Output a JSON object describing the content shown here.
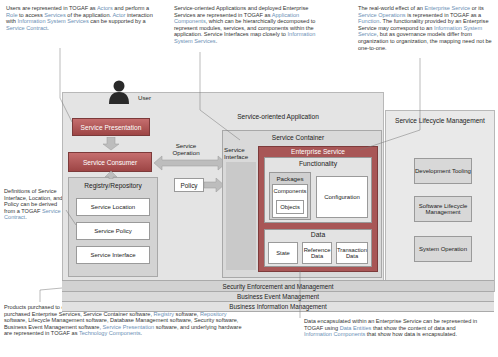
{
  "notes": {
    "top_left": {
      "segments": [
        {
          "t": "Users are represented in TOGAF as ",
          "hl": false
        },
        {
          "t": "Actors",
          "hl": true
        },
        {
          "t": " and perform a ",
          "hl": false
        },
        {
          "t": "Role",
          "hl": true
        },
        {
          "t": " to access ",
          "hl": false
        },
        {
          "t": "Services",
          "hl": true
        },
        {
          "t": " of the application. ",
          "hl": false
        },
        {
          "t": "Actor",
          "hl": true
        },
        {
          "t": " interaction with ",
          "hl": false
        },
        {
          "t": "Information System Services",
          "hl": true
        },
        {
          "t": " can be supported by a ",
          "hl": false
        },
        {
          "t": "Service Contract",
          "hl": true
        },
        {
          "t": ".",
          "hl": false
        }
      ]
    },
    "top_middle": {
      "segments": [
        {
          "t": "Service-oriented Applications and deployed Enterprise Services are represented in TOGAF as ",
          "hl": false
        },
        {
          "t": "Application Components",
          "hl": true
        },
        {
          "t": ", which can be hierarchically decomposed to represent modules, services, and components within the application. Service Interfaces map closely to ",
          "hl": false
        },
        {
          "t": "Information System Services",
          "hl": true
        },
        {
          "t": ".",
          "hl": false
        }
      ]
    },
    "top_right": {
      "segments": [
        {
          "t": "The real-world effect of an ",
          "hl": false
        },
        {
          "t": "Enterprise Service",
          "hl": true
        },
        {
          "t": " or its ",
          "hl": false
        },
        {
          "t": "Service Operations",
          "hl": true
        },
        {
          "t": " is represented in TOGAF as a ",
          "hl": false
        },
        {
          "t": "Function",
          "hl": true
        },
        {
          "t": ". The functionality provided by an Enterprise Service may correspond to an ",
          "hl": false
        },
        {
          "t": "Information System Service",
          "hl": true
        },
        {
          "t": ", but as governance models differ from organization to organization, the mapping need not be one-to-one.",
          "hl": false
        }
      ]
    },
    "mid_left": {
      "segments": [
        {
          "t": "Definitions of Service Interface, Location, and Policy can be derived from a TOGAF ",
          "hl": false
        },
        {
          "t": "Service Contract",
          "hl": true
        },
        {
          "t": ".",
          "hl": false
        }
      ]
    },
    "bottom_left": {
      "segments": [
        {
          "t": "Products purchased to create a Service-oriented Application, such as COTS packages, purchased Enterprise Services, Service Container software, ",
          "hl": false
        },
        {
          "t": "Registry",
          "hl": true
        },
        {
          "t": " software, ",
          "hl": false
        },
        {
          "t": "Repository",
          "hl": true
        },
        {
          "t": " software, Lifecycle Management software, Database Management software, Security software, Business Event Management software, ",
          "hl": false
        },
        {
          "t": "Service Presentation",
          "hl": true
        },
        {
          "t": " software, and underlying hardware are represented in TOGAF as ",
          "hl": false
        },
        {
          "t": "Technology Components",
          "hl": true
        },
        {
          "t": ".",
          "hl": false
        }
      ]
    },
    "bottom_right": {
      "segments": [
        {
          "t": "Data encapsulated within an Enterprise Service can be represented in TOGAF using ",
          "hl": false
        },
        {
          "t": "Data Entities",
          "hl": true
        },
        {
          "t": " that show the content of data and ",
          "hl": false
        },
        {
          "t": "Information Components",
          "hl": true
        },
        {
          "t": " that show how data is encapsulated.",
          "hl": false
        }
      ]
    }
  },
  "diagram": {
    "user_label": "User",
    "service_oriented_application": "Service-oriented Application",
    "service_presentation": "Service Presentation",
    "service_consumer": "Service Consumer",
    "service_operation": "Service Operation",
    "policy": "Policy",
    "registry_repository": {
      "title": "Registry/Repository",
      "items": [
        "Service Location",
        "Service Policy",
        "Service Interface"
      ]
    },
    "service_container": "Service Container",
    "service_interface": "Service Interface",
    "enterprise_service": "Enterprise Service",
    "functionality": "Functionality",
    "packages": "Packages",
    "components": "Components",
    "objects": "Objects",
    "configuration": "Configuration",
    "data": {
      "title": "Data",
      "items": [
        "State",
        "Reference Data",
        "Transaction Data"
      ]
    },
    "lifecycle": {
      "title": "Service Lifecycle Management",
      "items": [
        "Development Tooling",
        "Software Lifecycle Management",
        "System Operation"
      ]
    },
    "bars": [
      "Security Enforcement and Management",
      "Business Event Management",
      "Business Information Management"
    ]
  },
  "colors": {
    "accent_red": "#a84c4c",
    "highlight_text": "#6b8fb5",
    "panel_gray": "#e4e4e4",
    "bar_gray": "#d2d2d2"
  }
}
